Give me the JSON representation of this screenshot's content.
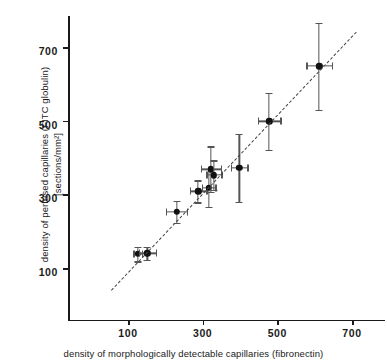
{
  "chart_data": {
    "type": "scatter",
    "title": "",
    "xlabel": "density of morphologically detectable capillaries (fibronectin)",
    "ylabel": "density of perfused capillaries  (FITC globulin)\n[sections/mm²]",
    "xlim": [
      40,
      750
    ],
    "ylim": [
      30,
      760
    ],
    "xticks": [
      100,
      300,
      500,
      700
    ],
    "yticks": [
      100,
      300,
      500,
      700
    ],
    "xtick_labels": [
      "100",
      "300",
      "500",
      "700"
    ],
    "ytick_labels": [
      "100",
      "300",
      "500",
      "700"
    ],
    "grid": false,
    "legend": null,
    "points": [
      {
        "x": 126,
        "y": 138,
        "xerr": 12,
        "yerr": 20
      },
      {
        "x": 152,
        "y": 140,
        "xerr": 22,
        "yerr": 18
      },
      {
        "x": 230,
        "y": 252,
        "xerr": 28,
        "yerr": 30
      },
      {
        "x": 288,
        "y": 308,
        "xerr": 22,
        "yerr": 30
      },
      {
        "x": 316,
        "y": 318,
        "xerr": 18,
        "yerr": 52
      },
      {
        "x": 322,
        "y": 368,
        "xerr": 26,
        "yerr": 62
      },
      {
        "x": 330,
        "y": 352,
        "xerr": 20,
        "yerr": 40
      },
      {
        "x": 398,
        "y": 372,
        "xerr": 22,
        "yerr": 92
      },
      {
        "x": 478,
        "y": 498,
        "xerr": 30,
        "yerr": 78
      },
      {
        "x": 612,
        "y": 648,
        "xerr": 34,
        "yerr": 118
      }
    ],
    "fit_line": {
      "style": "dashed",
      "x_start": 55,
      "y_start": 40,
      "x_end": 712,
      "y_end": 742
    }
  }
}
